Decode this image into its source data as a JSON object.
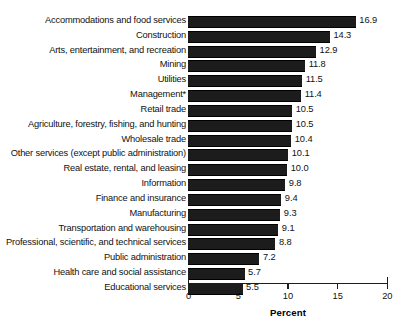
{
  "chart_data": {
    "type": "bar",
    "orientation": "horizontal",
    "title": "",
    "xlabel": "Percent",
    "ylabel": "",
    "xlim": [
      0,
      20
    ],
    "xticks": [
      0,
      5,
      10,
      15,
      20
    ],
    "xtick_labels": [
      "0",
      "5",
      "10",
      "15",
      "20"
    ],
    "grid": false,
    "legend": null,
    "bar_color": "#1c1c1c",
    "categories": [
      "Accommodations and food services",
      "Construction",
      "Arts, entertainment, and recreation",
      "Mining",
      "Utilities",
      "Management*",
      "Retail trade",
      "Agriculture, forestry, fishing, and hunting",
      "Wholesale trade",
      "Other services (except public administration)",
      "Real estate, rental, and leasing",
      "Information",
      "Finance and insurance",
      "Manufacturing",
      "Transportation and warehousing",
      "Professional, scientific, and technical services",
      "Public administration",
      "Health care and social assistance",
      "Educational services"
    ],
    "values": [
      16.9,
      14.3,
      12.9,
      11.8,
      11.5,
      11.4,
      10.5,
      10.5,
      10.4,
      10.1,
      10.0,
      9.8,
      9.4,
      9.3,
      9.1,
      8.8,
      7.2,
      5.7,
      5.5
    ],
    "value_labels": [
      "16.9",
      "14.3",
      "12.9",
      "11.8",
      "11.5",
      "11.4",
      "10.5",
      "10.5",
      "10.4",
      "10.1",
      "10.0",
      "9.8",
      "9.4",
      "9.3",
      "9.1",
      "8.8",
      "7.2",
      "5.7",
      "5.5"
    ]
  }
}
